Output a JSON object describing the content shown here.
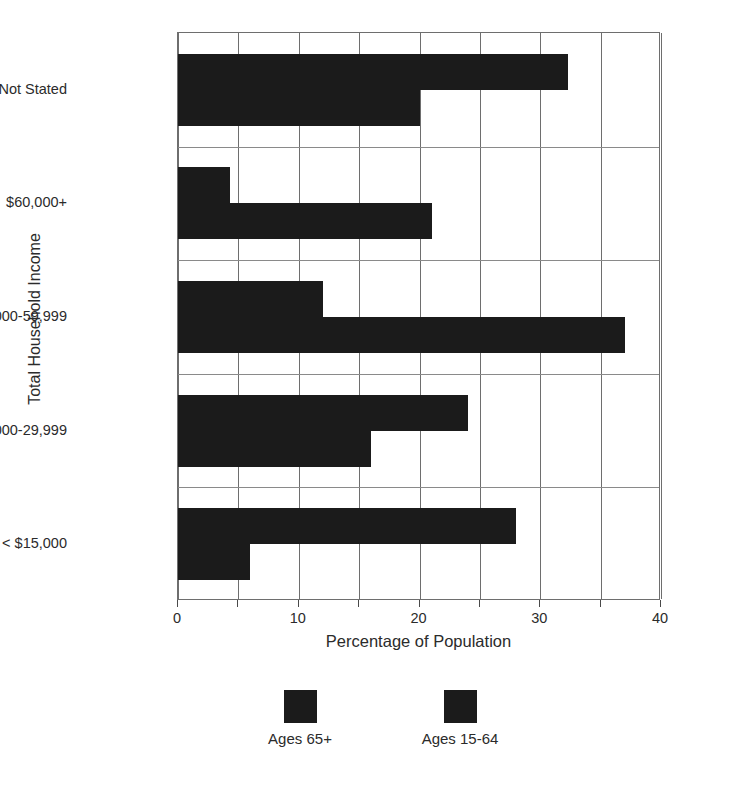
{
  "chart_data": {
    "type": "bar",
    "orientation": "horizontal",
    "title": "",
    "xlabel": "Percentage of Population",
    "ylabel": "Total Household Income",
    "categories": [
      "< $15,000",
      "$15,000-29,999",
      "$30,000-59,999",
      "$60,000+",
      "Not Stated"
    ],
    "series": [
      {
        "name": "Ages 65+",
        "values": [
          28,
          24,
          12,
          4.3,
          32.3
        ]
      },
      {
        "name": "Ages 15-64",
        "values": [
          6,
          16,
          37,
          21,
          20
        ]
      }
    ],
    "xlim": [
      0,
      40
    ],
    "xticks": [
      0,
      5,
      10,
      15,
      20,
      25,
      30,
      35,
      40
    ],
    "xtick_labels": [
      "0",
      "",
      "10",
      "",
      "20",
      "",
      "30",
      "",
      "40"
    ],
    "grid": true,
    "legend_position": "bottom",
    "bar_color": "#1b1b1b",
    "grid_color": "#6e6e6e",
    "axis_color": "#6e6e6e",
    "text_color": "#2b2b2b"
  },
  "legend": {
    "entries": [
      {
        "label": "Ages 65+"
      },
      {
        "label": "Ages 15-64"
      }
    ]
  }
}
